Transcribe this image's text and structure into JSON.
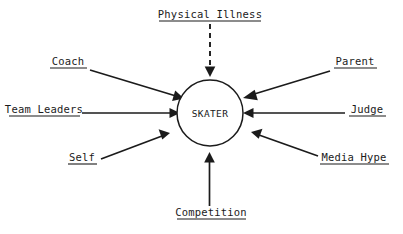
{
  "diagram": {
    "center": {
      "label": "SKATER",
      "shape": "circle",
      "cx": 210,
      "cy": 113,
      "r": 33
    },
    "colors": {
      "stroke": "#1b1b1b",
      "background": "#ffffff"
    },
    "nodes": [
      {
        "id": "physical-illness",
        "label": "Physical Illness",
        "text_x": 210,
        "text_y": 18,
        "anchor": "middle",
        "underline": {
          "x1": 159,
          "x2": 261,
          "y": 21
        },
        "connector": {
          "style": "dashed",
          "x1": 210,
          "y1": 24,
          "x2": 210,
          "y2": 70,
          "arrow_angle": 90
        }
      },
      {
        "id": "coach",
        "label": "Coach",
        "text_x": 68,
        "text_y": 65,
        "anchor": "middle",
        "underline": {
          "x1": 50,
          "x2": 87,
          "y": 68
        },
        "connector": {
          "style": "solid",
          "x1": 90,
          "y1": 70,
          "x2": 176,
          "y2": 96,
          "arrow_angle": 16.8
        }
      },
      {
        "id": "team-leaders",
        "label": "Team Leaders",
        "text_x": 44,
        "text_y": 113,
        "anchor": "middle",
        "underline": {
          "x1": 9,
          "x2": 80,
          "y": 116
        },
        "connector": {
          "style": "solid",
          "x1": 82,
          "y1": 113,
          "x2": 174,
          "y2": 113,
          "arrow_angle": 0
        }
      },
      {
        "id": "self",
        "label": "Self",
        "text_x": 82,
        "text_y": 161,
        "anchor": "middle",
        "underline": {
          "x1": 68,
          "x2": 97,
          "y": 164
        },
        "connector": {
          "style": "solid",
          "x1": 101,
          "y1": 159,
          "x2": 167,
          "y2": 133,
          "arrow_angle": -21.5
        }
      },
      {
        "id": "competition",
        "label": "Competition",
        "text_x": 211,
        "text_y": 216,
        "anchor": "middle",
        "underline": {
          "x1": 177,
          "x2": 246,
          "y": 219
        },
        "connector": {
          "style": "solid",
          "x1": 210,
          "y1": 206,
          "x2": 210,
          "y2": 154,
          "arrow_angle": -90
        }
      },
      {
        "id": "media-hype",
        "label": "Media Hype",
        "text_x": 354,
        "text_y": 161,
        "anchor": "middle",
        "underline": {
          "x1": 320,
          "x2": 389,
          "y": 164
        },
        "connector": {
          "style": "solid",
          "x1": 318,
          "y1": 156,
          "x2": 247,
          "y2": 131,
          "arrow_angle": 199.4
        }
      },
      {
        "id": "judge",
        "label": "Judge",
        "text_x": 367,
        "text_y": 113,
        "anchor": "middle",
        "underline": {
          "x1": 349,
          "x2": 386,
          "y": 116
        },
        "connector": {
          "style": "solid",
          "x1": 345,
          "y1": 113,
          "x2": 248,
          "y2": 113,
          "arrow_angle": 180
        }
      },
      {
        "id": "parent",
        "label": "Parent",
        "text_x": 355,
        "text_y": 65,
        "anchor": "middle",
        "underline": {
          "x1": 334,
          "x2": 377,
          "y": 68
        },
        "connector": {
          "style": "solid",
          "x1": 330,
          "y1": 71,
          "x2": 244,
          "y2": 98,
          "arrow_angle": 162.6
        }
      }
    ]
  }
}
